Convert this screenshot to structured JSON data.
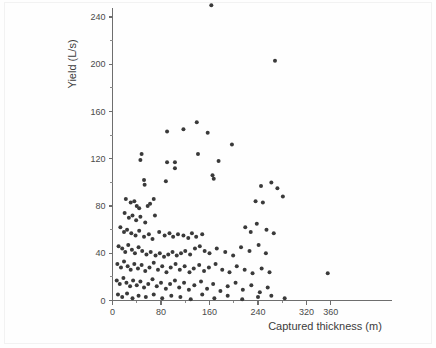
{
  "chart_data": {
    "type": "scatter",
    "title": "",
    "xlabel": "Captured thickness (m)",
    "ylabel": "Yield (L/s)",
    "xlim": [
      0,
      380
    ],
    "ylim": [
      0,
      255
    ],
    "grid": false,
    "legend": null,
    "xticks": [
      0,
      80,
      160,
      240,
      320,
      360
    ],
    "xtick_labels": [
      "0",
      "80",
      "160",
      "240",
      "320",
      "360"
    ],
    "xticks_minor": [
      40,
      120,
      200,
      280
    ],
    "yticks": [
      0,
      40,
      80,
      120,
      160,
      200,
      240
    ],
    "ytick_labels": [
      "0",
      "40",
      "80",
      "120",
      "160",
      "200",
      "240"
    ],
    "yticks_minor": [
      20,
      60,
      100,
      140,
      180,
      220
    ],
    "marker": "circle",
    "marker_color": "#3a3a3a",
    "marker_size": 4,
    "points": [
      [
        163,
        250
      ],
      [
        268,
        203
      ],
      [
        139,
        151
      ],
      [
        90,
        143
      ],
      [
        117,
        145
      ],
      [
        157,
        142
      ],
      [
        197,
        132
      ],
      [
        48,
        124
      ],
      [
        46,
        119
      ],
      [
        90,
        117
      ],
      [
        103,
        117
      ],
      [
        103,
        112
      ],
      [
        141,
        124
      ],
      [
        175,
        118
      ],
      [
        52,
        102
      ],
      [
        53,
        98
      ],
      [
        88,
        101
      ],
      [
        165,
        106
      ],
      [
        167,
        103
      ],
      [
        22,
        86
      ],
      [
        30,
        83
      ],
      [
        36,
        84
      ],
      [
        40,
        80
      ],
      [
        44,
        78
      ],
      [
        58,
        80
      ],
      [
        62,
        82
      ],
      [
        68,
        86
      ],
      [
        236,
        84
      ],
      [
        248,
        83
      ],
      [
        20,
        74
      ],
      [
        27,
        70
      ],
      [
        33,
        72
      ],
      [
        39,
        68
      ],
      [
        46,
        71
      ],
      [
        54,
        66
      ],
      [
        70,
        72
      ],
      [
        245,
        97
      ],
      [
        262,
        100
      ],
      [
        272,
        95
      ],
      [
        281,
        88
      ],
      [
        13,
        62
      ],
      [
        19,
        58
      ],
      [
        24,
        60
      ],
      [
        31,
        57
      ],
      [
        38,
        55
      ],
      [
        44,
        59
      ],
      [
        52,
        54
      ],
      [
        60,
        56
      ],
      [
        66,
        52
      ],
      [
        77,
        58
      ],
      [
        86,
        55
      ],
      [
        94,
        57
      ],
      [
        100,
        54
      ],
      [
        108,
        56
      ],
      [
        117,
        55
      ],
      [
        125,
        53
      ],
      [
        131,
        57
      ],
      [
        138,
        54
      ],
      [
        148,
        56
      ],
      [
        219,
        62
      ],
      [
        228,
        58
      ],
      [
        238,
        65
      ],
      [
        254,
        60
      ],
      [
        266,
        57
      ],
      [
        10,
        46
      ],
      [
        16,
        44
      ],
      [
        21,
        41
      ],
      [
        26,
        47
      ],
      [
        32,
        43
      ],
      [
        37,
        40
      ],
      [
        43,
        45
      ],
      [
        49,
        42
      ],
      [
        56,
        39
      ],
      [
        63,
        41
      ],
      [
        71,
        38
      ],
      [
        78,
        40
      ],
      [
        85,
        37
      ],
      [
        92,
        39
      ],
      [
        99,
        41
      ],
      [
        106,
        38
      ],
      [
        113,
        40
      ],
      [
        120,
        42
      ],
      [
        128,
        39
      ],
      [
        136,
        44
      ],
      [
        144,
        46
      ],
      [
        152,
        42
      ],
      [
        160,
        40
      ],
      [
        172,
        44
      ],
      [
        186,
        41
      ],
      [
        199,
        38
      ],
      [
        212,
        45
      ],
      [
        226,
        42
      ],
      [
        241,
        47
      ],
      [
        253,
        40
      ],
      [
        8,
        31
      ],
      [
        14,
        28
      ],
      [
        19,
        33
      ],
      [
        25,
        29
      ],
      [
        30,
        26
      ],
      [
        36,
        31
      ],
      [
        42,
        27
      ],
      [
        48,
        30
      ],
      [
        54,
        25
      ],
      [
        61,
        28
      ],
      [
        68,
        32
      ],
      [
        75,
        26
      ],
      [
        82,
        29
      ],
      [
        89,
        24
      ],
      [
        96,
        28
      ],
      [
        104,
        31
      ],
      [
        111,
        26
      ],
      [
        119,
        29
      ],
      [
        127,
        24
      ],
      [
        134,
        27
      ],
      [
        143,
        30
      ],
      [
        151,
        25
      ],
      [
        159,
        28
      ],
      [
        170,
        31
      ],
      [
        181,
        26
      ],
      [
        193,
        24
      ],
      [
        205,
        29
      ],
      [
        218,
        26
      ],
      [
        231,
        23
      ],
      [
        246,
        27
      ],
      [
        259,
        24
      ],
      [
        355,
        23
      ],
      [
        7,
        17
      ],
      [
        12,
        14
      ],
      [
        18,
        19
      ],
      [
        23,
        15
      ],
      [
        29,
        12
      ],
      [
        34,
        17
      ],
      [
        40,
        13
      ],
      [
        46,
        16
      ],
      [
        52,
        11
      ],
      [
        59,
        14
      ],
      [
        66,
        18
      ],
      [
        73,
        12
      ],
      [
        80,
        15
      ],
      [
        88,
        10
      ],
      [
        95,
        14
      ],
      [
        103,
        17
      ],
      [
        110,
        11
      ],
      [
        118,
        15
      ],
      [
        126,
        9
      ],
      [
        135,
        13
      ],
      [
        146,
        16
      ],
      [
        156,
        10
      ],
      [
        166,
        14
      ],
      [
        178,
        8
      ],
      [
        190,
        12
      ],
      [
        203,
        15
      ],
      [
        215,
        9
      ],
      [
        229,
        13
      ],
      [
        243,
        7
      ],
      [
        256,
        11
      ],
      [
        9,
        5
      ],
      [
        16,
        3
      ],
      [
        24,
        6
      ],
      [
        33,
        2
      ],
      [
        43,
        4
      ],
      [
        55,
        3
      ],
      [
        68,
        5
      ],
      [
        82,
        2
      ],
      [
        97,
        4
      ],
      [
        112,
        3
      ],
      [
        129,
        1
      ],
      [
        148,
        5
      ],
      [
        168,
        2
      ],
      [
        190,
        4
      ],
      [
        214,
        1
      ],
      [
        240,
        3
      ],
      [
        262,
        4
      ],
      [
        284,
        2
      ]
    ]
  }
}
